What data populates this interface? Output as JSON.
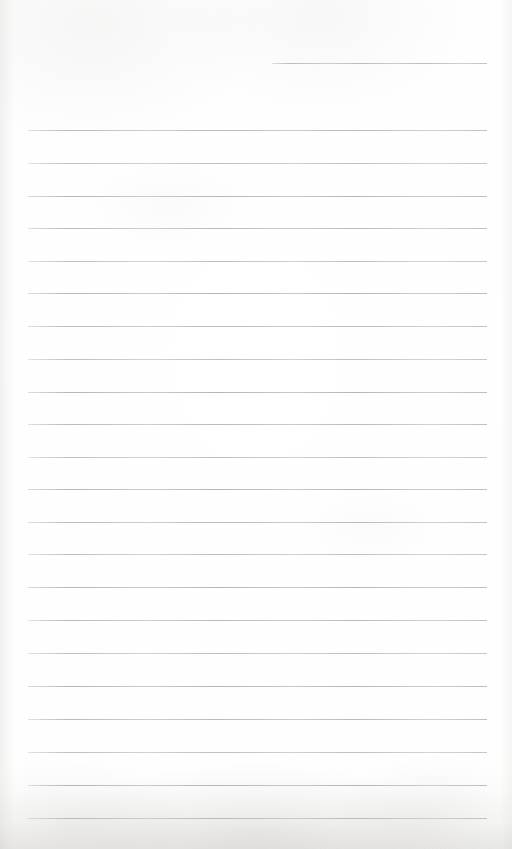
{
  "document": {
    "kind": "scanned-lined-paper",
    "title": "",
    "body_text": "",
    "page_width": 512,
    "page_height": 849,
    "background_color": "#fefefe",
    "rule_color": "#adb1b5",
    "rule_thickness_px": 1,
    "rule_spacing_px": 31.3,
    "left_margin_px": 28,
    "right_margin_px": 487,
    "total_rules": 24,
    "written_content": "none — the page is blank"
  },
  "rules": [
    {
      "index": 1,
      "y": 63,
      "x_start": 272,
      "x_end": 487,
      "style": "short"
    },
    {
      "index": 2,
      "y": 130,
      "x_start": 28,
      "x_end": 487,
      "style": "full"
    },
    {
      "index": 3,
      "y": 163,
      "x_start": 28,
      "x_end": 487,
      "style": "full"
    },
    {
      "index": 4,
      "y": 196,
      "x_start": 28,
      "x_end": 487,
      "style": "full"
    },
    {
      "index": 5,
      "y": 228,
      "x_start": 28,
      "x_end": 487,
      "style": "full"
    },
    {
      "index": 6,
      "y": 261,
      "x_start": 28,
      "x_end": 487,
      "style": "full"
    },
    {
      "index": 7,
      "y": 293,
      "x_start": 28,
      "x_end": 487,
      "style": "full"
    },
    {
      "index": 8,
      "y": 326,
      "x_start": 28,
      "x_end": 487,
      "style": "full"
    },
    {
      "index": 9,
      "y": 359,
      "x_start": 28,
      "x_end": 487,
      "style": "full"
    },
    {
      "index": 10,
      "y": 392,
      "x_start": 28,
      "x_end": 487,
      "style": "full"
    },
    {
      "index": 11,
      "y": 424,
      "x_start": 28,
      "x_end": 487,
      "style": "full"
    },
    {
      "index": 12,
      "y": 457,
      "x_start": 28,
      "x_end": 487,
      "style": "full"
    },
    {
      "index": 13,
      "y": 489,
      "x_start": 28,
      "x_end": 487,
      "style": "full"
    },
    {
      "index": 14,
      "y": 522,
      "x_start": 28,
      "x_end": 487,
      "style": "full"
    },
    {
      "index": 15,
      "y": 554,
      "x_start": 28,
      "x_end": 487,
      "style": "full"
    },
    {
      "index": 16,
      "y": 587,
      "x_start": 28,
      "x_end": 487,
      "style": "full"
    },
    {
      "index": 17,
      "y": 620,
      "x_start": 28,
      "x_end": 487,
      "style": "full"
    },
    {
      "index": 18,
      "y": 653,
      "x_start": 28,
      "x_end": 487,
      "style": "full"
    },
    {
      "index": 19,
      "y": 686,
      "x_start": 28,
      "x_end": 487,
      "style": "full"
    },
    {
      "index": 20,
      "y": 719,
      "x_start": 28,
      "x_end": 487,
      "style": "full"
    },
    {
      "index": 21,
      "y": 752,
      "x_start": 28,
      "x_end": 487,
      "style": "full"
    },
    {
      "index": 22,
      "y": 785,
      "x_start": 28,
      "x_end": 487,
      "style": "full"
    },
    {
      "index": 23,
      "y": 818,
      "x_start": 28,
      "x_end": 487,
      "style": "full"
    }
  ]
}
